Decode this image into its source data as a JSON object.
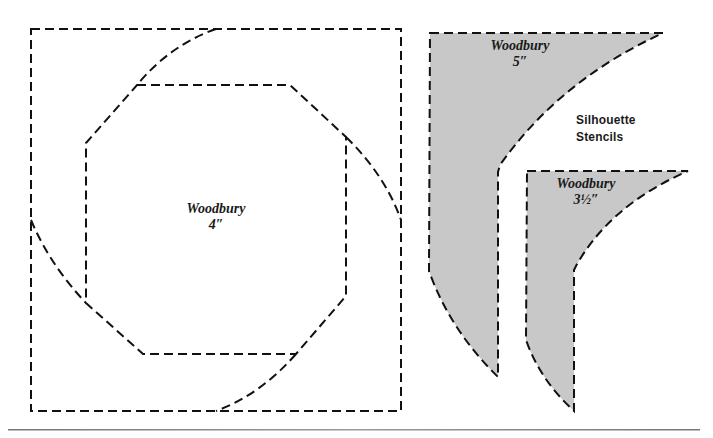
{
  "title": {
    "line1": "Silhouette",
    "line2": "Stencils"
  },
  "stencils": [
    {
      "name": "Woodbury",
      "size": "4″",
      "type": "block-outline"
    },
    {
      "name": "Woodbury",
      "size": "5″",
      "type": "silhouette"
    },
    {
      "name": "Woodbury",
      "size": "3½″",
      "type": "silhouette"
    }
  ],
  "colors": {
    "line": "#111111",
    "fill": "#c8c8c8",
    "rule": "#8a8a8a"
  }
}
